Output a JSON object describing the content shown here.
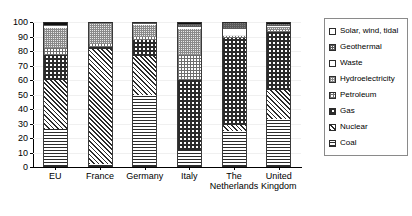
{
  "chart_data": {
    "type": "bar",
    "stacked": true,
    "title": "",
    "subtitle": "",
    "xlabel": "",
    "ylabel": "",
    "ylim": [
      0,
      100
    ],
    "yticks": [
      0,
      10,
      20,
      30,
      40,
      50,
      60,
      70,
      80,
      90,
      100
    ],
    "grid": false,
    "legend_position": "right",
    "categories": [
      "EU",
      "France",
      "Germany",
      "Italy",
      "The\nNetherlands",
      "United Kingdom"
    ],
    "series": [
      {
        "name": "Coal",
        "pattern": "horizontal-lines",
        "values": [
          26.0,
          2.0,
          50.0,
          12.0,
          25.0,
          33.0
        ]
      },
      {
        "name": "Nuclear",
        "pattern": "diagonal-hatch",
        "values": [
          34.0,
          80.0,
          27.0,
          0.0,
          4.0,
          20.0
        ]
      },
      {
        "name": "Gas",
        "pattern": "checkerboard",
        "values": [
          17.0,
          1.5,
          11.0,
          48.0,
          60.0,
          40.0
        ]
      },
      {
        "name": "Petroleum",
        "pattern": "fine-grid",
        "values": [
          5.0,
          1.5,
          2.0,
          17.0,
          2.0,
          1.5
        ]
      },
      {
        "name": "Hydroelectricity",
        "pattern": "light-grid",
        "values": [
          14.0,
          14.0,
          8.0,
          18.0,
          0.3,
          2.0
        ]
      },
      {
        "name": "Waste",
        "pattern": "solid-white",
        "values": [
          1.5,
          0.5,
          1.0,
          1.5,
          4.0,
          1.0
        ]
      },
      {
        "name": "Geothermal",
        "pattern": "dark-grey",
        "values": [
          0.5,
          0.3,
          0.5,
          2.0,
          3.7,
          1.0
        ]
      },
      {
        "name": "Solar, wind, tidal",
        "pattern": "solid-black",
        "values": [
          2.0,
          0.2,
          0.5,
          1.5,
          1.0,
          1.5
        ]
      }
    ]
  },
  "legend": {
    "items": [
      {
        "label": "Solar, wind, tidal"
      },
      {
        "label": "Geothermal"
      },
      {
        "label": "Waste"
      },
      {
        "label": "Hydroelectricity"
      },
      {
        "label": "Petroleum"
      },
      {
        "label": "Gas"
      },
      {
        "label": "Nuclear"
      },
      {
        "label": "Coal"
      }
    ]
  }
}
